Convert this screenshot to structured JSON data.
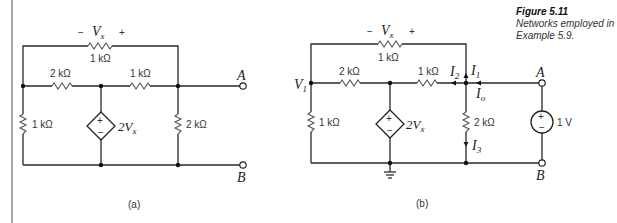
{
  "figure": {
    "title": "Figure 5.11",
    "caption": "Networks employed in Example 5.9."
  },
  "circuit_a": {
    "label": "(a)",
    "top_resistor": "1 kΩ",
    "vx_minus": "−",
    "vx_label": "V",
    "vx_sub": "x",
    "vx_plus": "+",
    "left_series_resistor": "2 kΩ",
    "right_series_resistor": "1 kΩ",
    "left_shunt_resistor": "1 kΩ",
    "right_shunt_resistor": "2 kΩ",
    "dependent_source": "2V",
    "dependent_source_sub": "x",
    "source_plus": "+",
    "source_minus": "−",
    "terminal_a": "A",
    "terminal_b": "B"
  },
  "circuit_b": {
    "label": "(b)",
    "top_resistor": "1 kΩ",
    "vx_minus": "−",
    "vx_label": "V",
    "vx_sub": "x",
    "vx_plus": "+",
    "node_v1": "V",
    "node_v1_sub": "1",
    "left_series_resistor": "2 kΩ",
    "right_series_resistor": "1 kΩ",
    "left_shunt_resistor": "1 kΩ",
    "right_shunt_resistor": "2 kΩ",
    "dependent_source": "2V",
    "dependent_source_sub": "x",
    "source_plus": "+",
    "source_minus": "−",
    "test_source": "1 V",
    "test_plus": "+",
    "test_minus": "−",
    "current_i1": "I",
    "current_i1_sub": "1",
    "current_i2": "I",
    "current_i2_sub": "2",
    "current_i3": "I",
    "current_i3_sub": "3",
    "current_io": "I",
    "current_io_sub": "o",
    "terminal_a": "A",
    "terminal_b": "B"
  }
}
